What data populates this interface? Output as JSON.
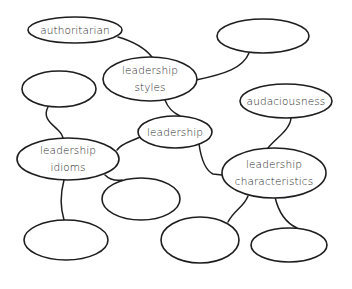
{
  "diagram": {
    "type": "mind-map",
    "colors": {
      "stroke": "#1e1e1e",
      "text": "#2b2b2b",
      "background": "#ffffff"
    },
    "nodes": [
      {
        "id": "authoritarian",
        "lines": [
          "authoritarian"
        ],
        "cx": 75,
        "cy": 30,
        "rx": 47,
        "ry": 13
      },
      {
        "id": "top-right-empty",
        "lines": [],
        "cx": 263,
        "cy": 36,
        "rx": 46,
        "ry": 17
      },
      {
        "id": "leadership-styles",
        "lines": [
          "leadership",
          "styles"
        ],
        "cx": 150,
        "cy": 79,
        "rx": 47,
        "ry": 22
      },
      {
        "id": "left-empty",
        "lines": [],
        "cx": 59,
        "cy": 89,
        "rx": 37,
        "ry": 18
      },
      {
        "id": "audaciousness",
        "lines": [
          "audaciousness"
        ],
        "cx": 286,
        "cy": 101,
        "rx": 46,
        "ry": 17
      },
      {
        "id": "leadership",
        "lines": [
          "leadership"
        ],
        "cx": 175,
        "cy": 132,
        "rx": 37,
        "ry": 16
      },
      {
        "id": "leadership-idioms",
        "lines": [
          "leadership",
          "idioms"
        ],
        "cx": 68,
        "cy": 159,
        "rx": 51,
        "ry": 21
      },
      {
        "id": "leadership-characteristics",
        "lines": [
          "leadership",
          "characteristics"
        ],
        "cx": 274,
        "cy": 173,
        "rx": 52,
        "ry": 25
      },
      {
        "id": "middle-empty",
        "lines": [],
        "cx": 141,
        "cy": 199,
        "rx": 39,
        "ry": 21
      },
      {
        "id": "bottom-left-empty",
        "lines": [],
        "cx": 66,
        "cy": 240,
        "rx": 42,
        "ry": 20
      },
      {
        "id": "bottom-middle-empty",
        "lines": [],
        "cx": 200,
        "cy": 240,
        "rx": 39,
        "ry": 23
      },
      {
        "id": "bottom-right-empty",
        "lines": [],
        "cx": 289,
        "cy": 245,
        "rx": 38,
        "ry": 17
      }
    ],
    "edges": [
      {
        "from": "authoritarian",
        "to": "leadership-styles",
        "path": "M118,37 C135,42 145,48 152,57"
      },
      {
        "from": "top-right-empty",
        "to": "leadership-styles",
        "path": "M249,53 C243,68 225,74 196,80"
      },
      {
        "from": "leadership-styles",
        "to": "leadership",
        "path": "M165,100 C168,108 172,112 180,116"
      },
      {
        "from": "left-empty",
        "to": "leadership-idioms",
        "path": "M48,107 C42,118 52,124 58,130 C62,134 63,137 63,139"
      },
      {
        "from": "leadership",
        "to": "leadership-idioms",
        "path": "M140,137 C130,142 122,143 117,150"
      },
      {
        "from": "audaciousness",
        "to": "leadership-characteristics",
        "path": "M291,118 C290,130 276,138 268,148"
      },
      {
        "from": "leadership",
        "to": "leadership-characteristics",
        "path": "M199,144 C201,158 205,170 213,174 L222,175"
      },
      {
        "from": "leadership-idioms",
        "to": "middle-empty",
        "path": "M105,175 C110,180 115,181 122,180"
      },
      {
        "from": "leadership-idioms",
        "to": "bottom-left-empty",
        "path": "M64,180 C60,195 61,210 64,220"
      },
      {
        "from": "leadership-characteristics",
        "to": "bottom-middle-empty",
        "path": "M248,196 C244,207 234,210 228,222"
      },
      {
        "from": "leadership-characteristics",
        "to": "bottom-right-empty",
        "path": "M275,197 C278,210 284,222 297,228"
      }
    ]
  }
}
